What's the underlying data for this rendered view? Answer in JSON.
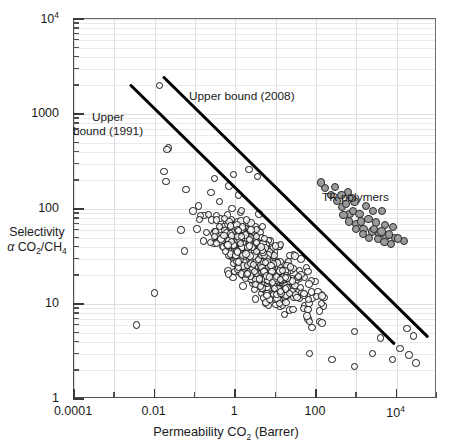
{
  "figure": {
    "kind": "robeson-upper-bound-plot",
    "background": "#ffffff"
  },
  "chart_data": {
    "type": "scatter",
    "title": "",
    "xlabel": "Permeability CO2 (Barrer)",
    "ylabel": "Selectivity α CO2/CH4",
    "xscale": "log",
    "yscale": "log",
    "xlim": [
      0.0001,
      100000
    ],
    "ylim": [
      1,
      10000
    ],
    "grid": true,
    "grid_color": "#e9e9ee",
    "legend": "none",
    "xticks": [
      "0.0001",
      "0.01",
      "1",
      "100",
      "10⁴"
    ],
    "xtick_values": [
      0.0001,
      0.01,
      1,
      100,
      10000
    ],
    "yticks": [
      "1",
      "10",
      "100",
      "1000",
      "10⁴"
    ],
    "ytick_values": [
      1,
      10,
      100,
      1000,
      10000
    ],
    "annotations": [
      {
        "text": "Upper bound (2008)",
        "x_px": 189,
        "y_px": 96
      },
      {
        "text": "Upper\nbound (1991)",
        "x_px": 98,
        "y_px": 118
      },
      {
        "text": "TR polymers",
        "x_px": 322,
        "y_px": 196
      }
    ],
    "lines": [
      {
        "name": "Upper bound (1991)",
        "color": "#000000",
        "width_px": 3.1,
        "x1": 0.0025,
        "y1": 2050,
        "x2": 9000,
        "y2": 3.8
      },
      {
        "name": "Upper bound (2008)",
        "color": "#000000",
        "width_px": 3.1,
        "x1": 0.016,
        "y1": 2450,
        "x2": 60000,
        "y2": 4.4
      }
    ],
    "series": [
      {
        "name": "Polymer membranes",
        "marker": "open-circle",
        "marker_color": "#141414",
        "fill": "none",
        "count": 620,
        "description": "Dense cloud of literature polymer data centred near 5 Barrer / 30 selectivity"
      },
      {
        "name": "TR polymers",
        "marker": "filled-circle",
        "marker_color": "#9b9b9b",
        "edge_color": "#2a2a2a",
        "count": 41,
        "description": "Grey filled circles lying on or above the 2008 upper bound"
      }
    ],
    "tr_points": [
      [
        620,
        150
      ],
      [
        900,
        120
      ],
      [
        1700,
        108
      ],
      [
        2600,
        96
      ],
      [
        4300,
        95
      ],
      [
        300,
        170
      ],
      [
        430,
        140
      ],
      [
        760,
        130
      ],
      [
        1200,
        88
      ],
      [
        2000,
        78
      ],
      [
        3100,
        72
      ],
      [
        5200,
        68
      ],
      [
        8000,
        64
      ],
      [
        1500,
        62
      ],
      [
        2400,
        58
      ],
      [
        3600,
        55
      ],
      [
        5600,
        52
      ],
      [
        9000,
        50
      ],
      [
        1000,
        70
      ],
      [
        680,
        88
      ],
      [
        450,
        105
      ],
      [
        330,
        122
      ],
      [
        240,
        140
      ],
      [
        170,
        165
      ],
      [
        2800,
        62
      ],
      [
        4200,
        58
      ],
      [
        6400,
        54
      ],
      [
        1300,
        74
      ],
      [
        820,
        96
      ],
      [
        560,
        112
      ],
      [
        3400,
        48
      ],
      [
        5000,
        45
      ],
      [
        7200,
        43
      ],
      [
        2100,
        50
      ],
      [
        1450,
        55
      ],
      [
        980,
        62
      ],
      [
        660,
        74
      ],
      [
        480,
        86
      ],
      [
        15000,
        46
      ],
      [
        11000,
        49
      ],
      [
        130,
        190
      ]
    ]
  }
}
